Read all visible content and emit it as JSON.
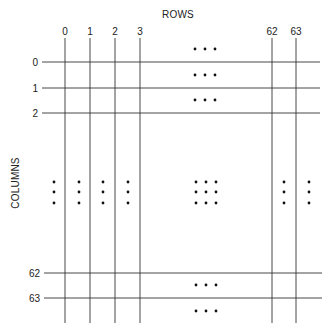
{
  "diagram": {
    "x_axis_title": "ROWS",
    "y_axis_title": "COLUMNS",
    "column_labels": [
      "0",
      "1",
      "2",
      "3",
      "62",
      "63"
    ],
    "row_labels": [
      "0",
      "1",
      "2",
      "62",
      "63"
    ],
    "ellipsis_glyph": "• • •",
    "colors": {
      "line": "#333333",
      "dot": "#111111",
      "text": "#222222",
      "background": "#ffffff"
    }
  }
}
